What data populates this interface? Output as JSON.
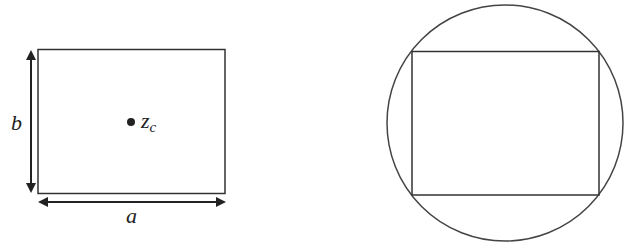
{
  "left_figure": {
    "width_label": "a",
    "height_label": "b",
    "center_label": "z",
    "center_subscript": "c"
  },
  "right_figure": {
    "description": "rectangle inscribed in circle"
  },
  "colors": {
    "stroke": "#333333",
    "background": "#ffffff"
  }
}
